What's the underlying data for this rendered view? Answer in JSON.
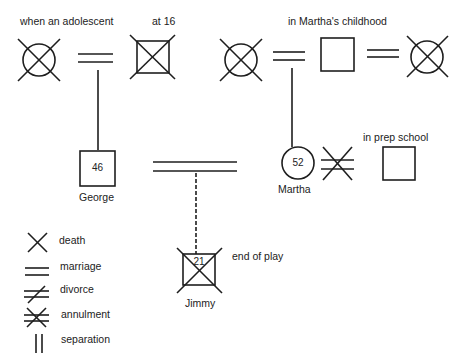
{
  "labels": {
    "adolescent": "when an adolescent",
    "at16": "at 16",
    "childhood": "in Martha's childhood",
    "prep": "in prep school",
    "end_of_play": "end of play"
  },
  "people": {
    "george": {
      "name": "George",
      "age": "46",
      "shape": "square"
    },
    "martha": {
      "name": "Martha",
      "age": "52",
      "shape": "circle"
    },
    "jimmy": {
      "name": "Jimmy",
      "age": "21",
      "shape": "square",
      "status": "deceased"
    },
    "george_mother": {
      "shape": "circle",
      "status": "deceased"
    },
    "george_father": {
      "shape": "square",
      "status": "deceased"
    },
    "martha_mother": {
      "shape": "circle",
      "status": "deceased"
    },
    "martha_father": {
      "shape": "square"
    },
    "martha_stepmother": {
      "shape": "circle",
      "status": "deceased"
    },
    "martha_ex_husband": {
      "shape": "square"
    }
  },
  "relations": [
    {
      "type": "marriage",
      "between": [
        "george_mother",
        "george_father"
      ]
    },
    {
      "type": "marriage",
      "between": [
        "martha_mother",
        "martha_father"
      ]
    },
    {
      "type": "marriage",
      "between": [
        "martha_father",
        "martha_stepmother"
      ]
    },
    {
      "type": "marriage",
      "between": [
        "george",
        "martha"
      ]
    },
    {
      "type": "annulment",
      "between": [
        "martha",
        "martha_ex_husband"
      ]
    },
    {
      "type": "imaginary-child",
      "parents": [
        "george",
        "martha"
      ],
      "child": "jimmy"
    }
  ],
  "legend": [
    {
      "symbol": "death",
      "label": "death"
    },
    {
      "symbol": "marriage",
      "label": "marriage"
    },
    {
      "symbol": "divorce",
      "label": "divorce"
    },
    {
      "symbol": "annulment",
      "label": "annulment"
    },
    {
      "symbol": "separation",
      "label": "separation"
    }
  ],
  "colors": {
    "ink": "#1e1e1e",
    "background": "#ffffff"
  }
}
